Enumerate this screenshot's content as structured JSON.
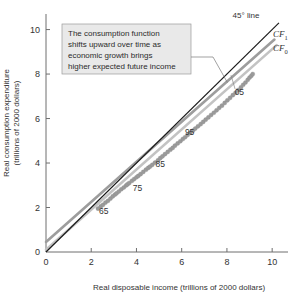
{
  "chart_data": {
    "type": "scatter",
    "title": "",
    "xlabel": "Real disposable income (trillions of 2000 dollars)",
    "ylabel": "Real consumption expenditure (trillions of 2000 dollars)",
    "ylabel_line1": "Real consumption expenditure",
    "ylabel_line2": "(trillions of 2000 dollars)",
    "xlim": [
      0,
      10.7
    ],
    "ylim": [
      0,
      10.7
    ],
    "xticks": [
      0,
      2,
      4,
      6,
      8,
      10
    ],
    "yticks": [
      0,
      2,
      4,
      6,
      8,
      10
    ],
    "xticklabels": [
      "0",
      "2",
      "4",
      "6",
      "8",
      "10"
    ],
    "yticklabels": [
      "0",
      "2",
      "4",
      "6",
      "8",
      "10"
    ],
    "grid": false,
    "legend_position": "upper-right-inline",
    "annotations": [
      {
        "name": "callout",
        "text_lines": [
          "The consumption function",
          "shifts upward over time as",
          "economic growth brings",
          "higher expected future income"
        ]
      }
    ],
    "point_labels": [
      {
        "label": "65",
        "x": 2.55,
        "y": 1.72
      },
      {
        "label": "75",
        "x": 4.05,
        "y": 2.72
      },
      {
        "label": "85",
        "x": 5.05,
        "y": 3.82
      },
      {
        "label": "95",
        "x": 6.35,
        "y": 5.28
      },
      {
        "label": "05",
        "x": 8.55,
        "y": 7.05
      }
    ],
    "series": [
      {
        "name": "45-degree line",
        "label": "45° line",
        "type": "line",
        "color": "#1a1a1a",
        "points": [
          [
            0,
            0
          ],
          [
            10.3,
            10.3
          ]
        ]
      },
      {
        "name": "CF1",
        "label": "CF",
        "sublabel": "1",
        "type": "line",
        "color": "#9d9d9d",
        "points": [
          [
            0,
            0.45
          ],
          [
            10.1,
            9.55
          ]
        ]
      },
      {
        "name": "CF0",
        "label": "CF",
        "sublabel": "0",
        "type": "line",
        "color": "#c3c3c3",
        "points": [
          [
            0,
            0.1
          ],
          [
            10.2,
            9.3
          ]
        ]
      },
      {
        "name": "consumption-data",
        "type": "scatter",
        "color": "#9a9a9a",
        "points": [
          [
            2.3,
            1.95
          ],
          [
            2.42,
            2.05
          ],
          [
            2.52,
            2.12
          ],
          [
            2.63,
            2.22
          ],
          [
            2.74,
            2.3
          ],
          [
            2.85,
            2.4
          ],
          [
            2.95,
            2.5
          ],
          [
            3.05,
            2.58
          ],
          [
            3.12,
            2.64
          ],
          [
            3.22,
            2.72
          ],
          [
            3.33,
            2.82
          ],
          [
            3.44,
            2.9
          ],
          [
            3.54,
            2.99
          ],
          [
            3.6,
            3.04
          ],
          [
            3.68,
            3.1
          ],
          [
            3.8,
            3.2
          ],
          [
            3.9,
            3.28
          ],
          [
            4.0,
            3.36
          ],
          [
            4.08,
            3.42
          ],
          [
            4.18,
            3.5
          ],
          [
            4.3,
            3.6
          ],
          [
            4.42,
            3.7
          ],
          [
            4.52,
            3.78
          ],
          [
            4.6,
            3.84
          ],
          [
            4.7,
            3.92
          ],
          [
            4.82,
            4.02
          ],
          [
            4.95,
            4.12
          ],
          [
            5.05,
            4.22
          ],
          [
            5.15,
            4.3
          ],
          [
            5.26,
            4.4
          ],
          [
            5.38,
            4.5
          ],
          [
            5.5,
            4.6
          ],
          [
            5.6,
            4.68
          ],
          [
            5.7,
            4.78
          ],
          [
            5.82,
            4.88
          ],
          [
            5.94,
            4.98
          ],
          [
            6.05,
            5.08
          ],
          [
            6.15,
            5.16
          ],
          [
            6.26,
            5.26
          ],
          [
            6.38,
            5.36
          ],
          [
            6.5,
            5.46
          ],
          [
            6.6,
            5.55
          ],
          [
            6.72,
            5.65
          ],
          [
            6.84,
            5.75
          ],
          [
            6.95,
            5.85
          ],
          [
            7.06,
            5.95
          ],
          [
            7.18,
            6.05
          ],
          [
            7.3,
            6.16
          ],
          [
            7.42,
            6.26
          ],
          [
            7.54,
            6.37
          ],
          [
            7.66,
            6.48
          ],
          [
            7.78,
            6.58
          ],
          [
            7.9,
            6.7
          ],
          [
            8.02,
            6.82
          ],
          [
            8.14,
            6.93
          ],
          [
            8.26,
            7.05
          ],
          [
            8.38,
            7.16
          ],
          [
            8.5,
            7.28
          ],
          [
            8.62,
            7.4
          ],
          [
            8.72,
            7.52
          ],
          [
            8.82,
            7.62
          ],
          [
            8.92,
            7.74
          ],
          [
            9.0,
            7.84
          ],
          [
            9.08,
            7.92
          ],
          [
            9.14,
            8.0
          ]
        ]
      }
    ]
  }
}
